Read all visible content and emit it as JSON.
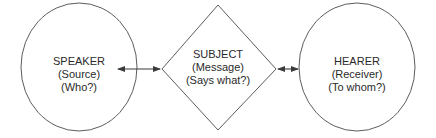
{
  "diagram": {
    "type": "communication-model",
    "nodes": [
      {
        "id": "speaker",
        "shape": "ellipse",
        "title": "SPEAKER",
        "role": "(Source)",
        "question": "(Who?)"
      },
      {
        "id": "subject",
        "shape": "diamond",
        "title": "SUBJECT",
        "role": "(Message)",
        "question": "(Says what?)"
      },
      {
        "id": "hearer",
        "shape": "ellipse",
        "title": "HEARER",
        "role": "(Receiver)",
        "question": "(To whom?)"
      }
    ],
    "edges": [
      {
        "from": "speaker",
        "to": "subject",
        "direction": "bidirectional"
      },
      {
        "from": "subject",
        "to": "hearer",
        "direction": "bidirectional"
      }
    ],
    "colors": {
      "stroke": "#4a4a4a",
      "text": "#2a2a2a",
      "background": "#ffffff"
    }
  }
}
